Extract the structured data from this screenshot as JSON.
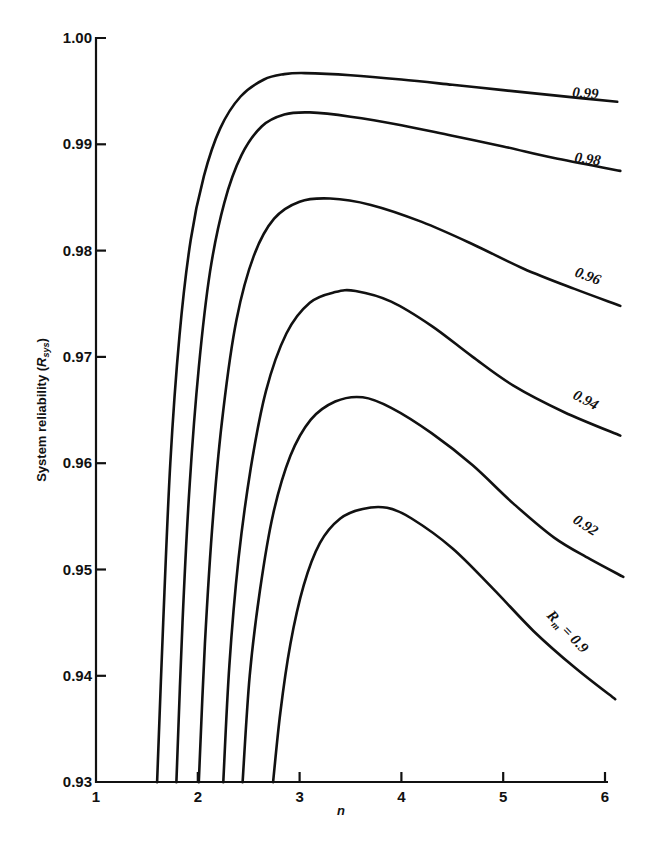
{
  "chart_data": {
    "type": "line",
    "title": "",
    "xlabel": "n",
    "ylabel": "System reliability (R_sys)",
    "ylabel_main": "System reliability (",
    "ylabel_sym": "R",
    "ylabel_sub": "sys",
    "ylabel_close": ")",
    "xlim": [
      1,
      6.15
    ],
    "ylim": [
      0.93,
      1.0
    ],
    "grid": false,
    "legend": "inline labels at curve ends",
    "x_ticks": [
      1,
      2,
      3,
      4,
      5,
      6
    ],
    "x_tick_labels": [
      "1",
      "2",
      "3",
      "4",
      "5",
      "6"
    ],
    "y_ticks": [
      0.93,
      0.94,
      0.95,
      0.96,
      0.97,
      0.98,
      0.99,
      1.0
    ],
    "y_tick_labels": [
      "0.93",
      "0.94",
      "0.95",
      "0.96",
      "0.97",
      "0.98",
      "0.99",
      "1.00"
    ],
    "series": [
      {
        "name": "0.99",
        "label": "0.99",
        "points": [
          [
            1.6,
            0.93
          ],
          [
            1.66,
            0.945
          ],
          [
            1.73,
            0.96
          ],
          [
            1.82,
            0.972
          ],
          [
            1.93,
            0.981
          ],
          [
            2.06,
            0.987
          ],
          [
            2.22,
            0.9915
          ],
          [
            2.42,
            0.9945
          ],
          [
            2.65,
            0.9961
          ],
          [
            2.85,
            0.9966
          ],
          [
            3.05,
            0.9967
          ],
          [
            3.5,
            0.9965
          ],
          [
            4.0,
            0.9961
          ],
          [
            4.5,
            0.9956
          ],
          [
            5.0,
            0.9951
          ],
          [
            5.5,
            0.9946
          ],
          [
            6.12,
            0.994
          ]
        ]
      },
      {
        "name": "0.98",
        "label": "0.98",
        "points": [
          [
            1.79,
            0.93
          ],
          [
            1.85,
            0.945
          ],
          [
            1.92,
            0.958
          ],
          [
            2.01,
            0.969
          ],
          [
            2.12,
            0.978
          ],
          [
            2.26,
            0.9845
          ],
          [
            2.43,
            0.989
          ],
          [
            2.63,
            0.9917
          ],
          [
            2.85,
            0.9928
          ],
          [
            3.1,
            0.993
          ],
          [
            3.5,
            0.9926
          ],
          [
            4.0,
            0.9918
          ],
          [
            4.5,
            0.9908
          ],
          [
            5.0,
            0.9898
          ],
          [
            5.5,
            0.9887
          ],
          [
            6.15,
            0.9875
          ]
        ]
      },
      {
        "name": "0.96",
        "label": "0.96",
        "points": [
          [
            2.01,
            0.93
          ],
          [
            2.07,
            0.943
          ],
          [
            2.15,
            0.955
          ],
          [
            2.25,
            0.965
          ],
          [
            2.38,
            0.9735
          ],
          [
            2.55,
            0.9795
          ],
          [
            2.75,
            0.983
          ],
          [
            3.0,
            0.9846
          ],
          [
            3.3,
            0.9849
          ],
          [
            3.7,
            0.9843
          ],
          [
            4.2,
            0.9827
          ],
          [
            4.7,
            0.9806
          ],
          [
            5.2,
            0.9783
          ],
          [
            5.7,
            0.9764
          ],
          [
            6.15,
            0.9748
          ]
        ]
      },
      {
        "name": "0.94",
        "label": "0.94",
        "points": [
          [
            2.25,
            0.93
          ],
          [
            2.31,
            0.941
          ],
          [
            2.4,
            0.951
          ],
          [
            2.52,
            0.9595
          ],
          [
            2.67,
            0.9668
          ],
          [
            2.87,
            0.9722
          ],
          [
            3.1,
            0.9751
          ],
          [
            3.35,
            0.9761
          ],
          [
            3.55,
            0.9762
          ],
          [
            3.9,
            0.9752
          ],
          [
            4.3,
            0.9729
          ],
          [
            4.7,
            0.97
          ],
          [
            5.1,
            0.9673
          ],
          [
            5.6,
            0.9648
          ],
          [
            6.15,
            0.9626
          ]
        ]
      },
      {
        "name": "0.92",
        "label": "0.92",
        "points": [
          [
            2.44,
            0.93
          ],
          [
            2.51,
            0.94
          ],
          [
            2.61,
            0.948
          ],
          [
            2.74,
            0.9552
          ],
          [
            2.91,
            0.9607
          ],
          [
            3.11,
            0.9641
          ],
          [
            3.35,
            0.9658
          ],
          [
            3.62,
            0.9662
          ],
          [
            3.9,
            0.9652
          ],
          [
            4.3,
            0.9628
          ],
          [
            4.7,
            0.9598
          ],
          [
            5.1,
            0.9562
          ],
          [
            5.5,
            0.953
          ],
          [
            5.85,
            0.951
          ],
          [
            6.18,
            0.9493
          ]
        ]
      },
      {
        "name": "0.9",
        "label": "Rm = 0.9",
        "label_sym": "R",
        "label_sub": "m",
        "label_rest": " = 0.9",
        "points": [
          [
            2.74,
            0.93
          ],
          [
            2.81,
            0.9365
          ],
          [
            2.91,
            0.943
          ],
          [
            3.04,
            0.9485
          ],
          [
            3.2,
            0.9525
          ],
          [
            3.4,
            0.9548
          ],
          [
            3.62,
            0.9557
          ],
          [
            3.86,
            0.9558
          ],
          [
            4.1,
            0.9548
          ],
          [
            4.5,
            0.952
          ],
          [
            4.9,
            0.9482
          ],
          [
            5.3,
            0.9442
          ],
          [
            5.7,
            0.9408
          ],
          [
            6.1,
            0.9378
          ]
        ]
      }
    ]
  }
}
